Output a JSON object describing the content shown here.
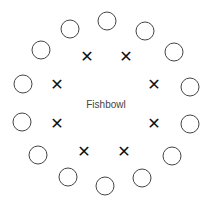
{
  "diagram": {
    "center_label": "Fishbowl",
    "outer_seats": [
      {
        "x": 107,
        "y": 21
      },
      {
        "x": 145,
        "y": 31
      },
      {
        "x": 174,
        "y": 52
      },
      {
        "x": 190,
        "y": 87
      },
      {
        "x": 190,
        "y": 124
      },
      {
        "x": 172,
        "y": 156
      },
      {
        "x": 142,
        "y": 178
      },
      {
        "x": 105,
        "y": 186
      },
      {
        "x": 68,
        "y": 177
      },
      {
        "x": 38,
        "y": 155
      },
      {
        "x": 22,
        "y": 122
      },
      {
        "x": 23,
        "y": 84
      },
      {
        "x": 41,
        "y": 50
      },
      {
        "x": 70,
        "y": 29
      }
    ],
    "inner_marks": [
      {
        "x": 87,
        "y": 57,
        "symbol": "x"
      },
      {
        "x": 126,
        "y": 57,
        "symbol": "x"
      },
      {
        "x": 154,
        "y": 85,
        "symbol": "x"
      },
      {
        "x": 154,
        "y": 124,
        "symbol": "x"
      },
      {
        "x": 124,
        "y": 152,
        "symbol": "x"
      },
      {
        "x": 84,
        "y": 152,
        "symbol": "x"
      },
      {
        "x": 57,
        "y": 124,
        "symbol": "x"
      },
      {
        "x": 57,
        "y": 85,
        "symbol": "x"
      }
    ]
  }
}
